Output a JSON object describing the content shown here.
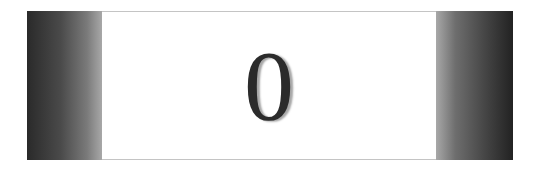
{
  "card": {
    "character": "0",
    "colors": {
      "panel_dark": "#222222",
      "panel_light": "#a8a8a8",
      "border": "#c4c4c4",
      "glyph": "#2b2b2b"
    }
  }
}
